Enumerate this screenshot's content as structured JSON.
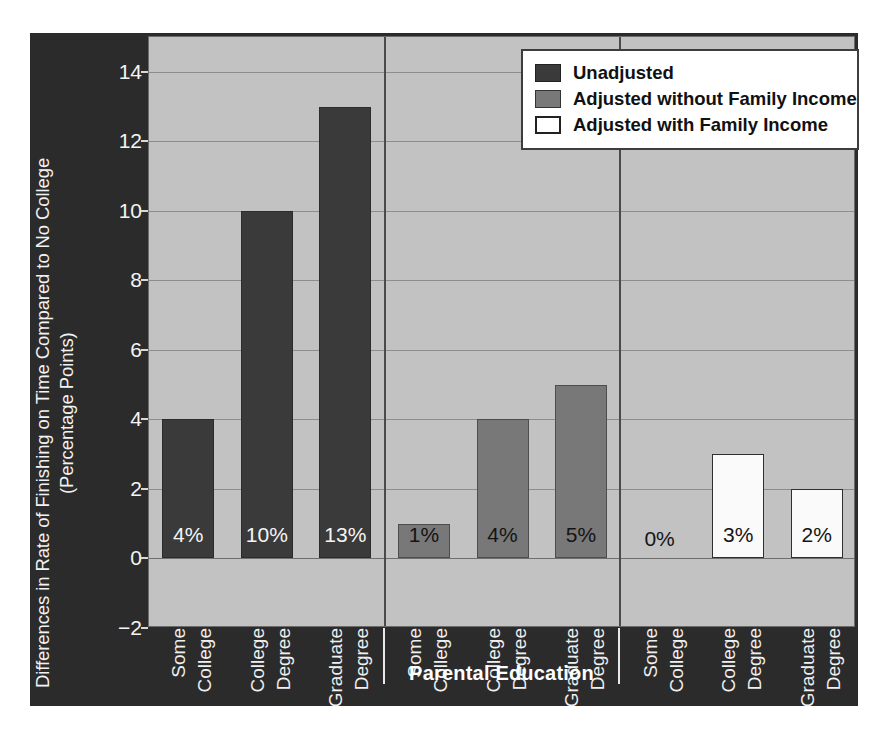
{
  "chart_data": {
    "type": "bar",
    "title": "",
    "xlabel": "Parental Education",
    "ylabel": "Differences in Rate of Finishing on Time Compared to No College (Percentage Points)",
    "ylabel_line1": "Differences in Rate of Finishing on Time Compared to No College",
    "ylabel_line2": "(Percentage Points)",
    "ylim": [
      -2,
      15
    ],
    "yticks": [
      -2,
      0,
      2,
      4,
      6,
      8,
      10,
      12,
      14
    ],
    "ytick_labels": [
      "−2",
      "0",
      "2",
      "4",
      "6",
      "8",
      "10",
      "12",
      "14"
    ],
    "grid": true,
    "legend_position": "upper right",
    "grouped_by": "series",
    "categories": [
      "Some College",
      "College Degree",
      "Graduate Degree"
    ],
    "category_lines": [
      [
        "Some",
        "College"
      ],
      [
        "College",
        "Degree"
      ],
      [
        "Graduate",
        "Degree"
      ]
    ],
    "series": [
      {
        "name": "Unadjusted",
        "color": "#3a3a3a",
        "values": [
          4,
          10,
          13
        ],
        "data_labels": [
          "4%",
          "10%",
          "13%"
        ]
      },
      {
        "name": "Adjusted without Family Income",
        "color": "#787878",
        "values": [
          1,
          4,
          5
        ],
        "data_labels": [
          "1%",
          "4%",
          "5%"
        ]
      },
      {
        "name": "Adjusted with Family Income",
        "color": "#ffffff",
        "values": [
          0,
          3,
          2
        ],
        "data_labels": [
          "0%",
          "3%",
          "2%"
        ]
      }
    ]
  },
  "legend": {
    "items": [
      {
        "label": "Unadjusted",
        "color": "#3a3a3a"
      },
      {
        "label": "Adjusted without Family Income",
        "color": "#787878"
      },
      {
        "label": "Adjusted with Family Income",
        "color": "#ffffff"
      }
    ]
  },
  "colors": {
    "figure_background": "#2b2b2b",
    "plot_background": "#c2c2c2",
    "gridline": "#8d8d8d",
    "axis_text": "#f2f2f2",
    "legend_background": "#ffffff",
    "legend_text": "#111111"
  }
}
